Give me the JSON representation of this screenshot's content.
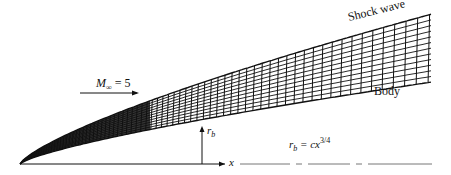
{
  "figure": {
    "shock_label": "Shock wave",
    "body_label": "Body",
    "freestream": {
      "symbol": "M",
      "subscript": "∞",
      "equals": " = 5"
    },
    "radius_label": {
      "symbol": "r",
      "subscript": "b"
    },
    "x_axis_label": "x",
    "equation": {
      "lhs": "r",
      "lhs_sub": "b",
      "rhs": " = cx",
      "exponent": "3/4"
    },
    "body_exponent": 0.75,
    "mach": 5,
    "colors": {
      "ink": "#111111",
      "background": "#ffffff"
    }
  }
}
